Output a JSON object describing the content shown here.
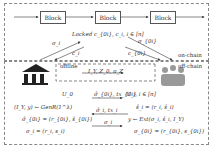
{
  "on_chain": {
    "label": "on-chain",
    "blocks": [
      "Block",
      "Block",
      "Block"
    ],
    "locked_text": "Locked c_{0i}, c_i, i ∈ [n]",
    "left_up": "σ_i",
    "left_down": "c_i",
    "right_up": "σ_{0i}",
    "right_down": "c_{0i}"
  },
  "off_chain": {
    "label": "off-chain",
    "offline_label": "offline",
    "offline_msg": "I_Y, Z_0, π_Z",
    "u0_label": "U_0",
    "ui_label": "U_i, i ∈ [n]",
    "arrows": [
      "σ̂_{0i}, tx_{0i}",
      "σ̂_i, tx_i",
      "σ_i"
    ],
    "left_lines": [
      "(I_Y, y) ← GenR(1^λ)",
      "σ̂_{0i} = (r_{0i}, ŝ_{0i})",
      "σ_i = (r_i, s_i)"
    ],
    "right_lines": [
      "ŝ_i = (r_i, ŝ_i)",
      "y ← Ext(σ_i, ŝ_i, I_Y)",
      "σ_{0i} = (r_{0i}, s_{0i})"
    ]
  }
}
